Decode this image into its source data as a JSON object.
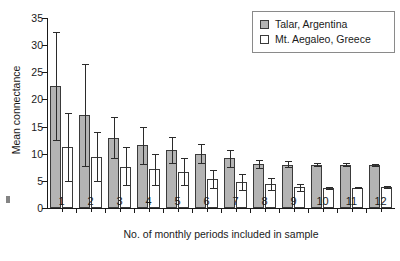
{
  "chart_data": {
    "type": "bar",
    "title": "",
    "subtitle": "",
    "xlabel": "No. of monthly periods included in sample",
    "ylabel": "Mean connectance",
    "categories": [
      "1",
      "2",
      "3",
      "4",
      "5",
      "6",
      "7",
      "8",
      "9",
      "10",
      "11",
      "12"
    ],
    "ylim": [
      0,
      35
    ],
    "y_ticks": [
      0,
      5,
      10,
      15,
      20,
      25,
      30,
      35
    ],
    "grid": false,
    "legend_position": "top-right",
    "error_bars": "visible",
    "series": [
      {
        "name": "Talar, Argentina",
        "color": "#b4b4b4",
        "values": [
          22.5,
          17.2,
          12.9,
          11.6,
          10.6,
          10.0,
          9.2,
          8.1,
          8.0,
          8.0,
          8.0,
          7.9
        ],
        "err_low": [
          12.5,
          7.8,
          9.2,
          8.1,
          8.3,
          8.2,
          7.6,
          7.3,
          7.5,
          7.7,
          7.7,
          7.7
        ],
        "err_high": [
          32.5,
          26.5,
          16.8,
          15.0,
          13.0,
          11.8,
          10.7,
          8.9,
          8.6,
          8.3,
          8.3,
          8.1
        ]
      },
      {
        "name": "Mt. Aegaleo, Greece",
        "color": "#ffffff",
        "values": [
          11.3,
          9.4,
          7.6,
          7.1,
          6.7,
          5.3,
          4.8,
          4.4,
          3.8,
          3.7,
          3.7,
          3.8
        ],
        "err_low": [
          4.9,
          4.9,
          4.3,
          4.2,
          4.2,
          3.6,
          3.3,
          3.3,
          3.2,
          3.5,
          3.6,
          3.6
        ],
        "err_high": [
          17.5,
          14.0,
          11.2,
          10.0,
          9.3,
          7.0,
          6.3,
          5.5,
          4.4,
          3.9,
          3.8,
          4.0
        ]
      }
    ]
  },
  "legend": {
    "items": [
      {
        "label": "Talar, Argentina",
        "swatch": "filled-gray-square"
      },
      {
        "label": "Mt. Aegaleo, Greece",
        "swatch": "empty-white-square"
      }
    ]
  },
  "colors": {
    "series_a": "#b4b4b4",
    "series_b": "#ffffff",
    "axis": "#1a1a1a",
    "error_bar": "#2b2b2b",
    "legend_border": "#8a8a8a",
    "background": "#ffffff"
  }
}
